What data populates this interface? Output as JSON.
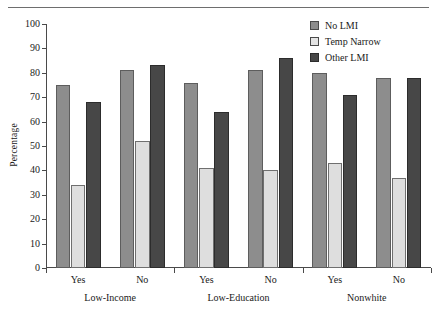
{
  "chart_data": {
    "type": "bar",
    "title": "",
    "xlabel": "",
    "ylabel": "Percentage",
    "ylim": [
      0,
      100
    ],
    "yticks": [
      0,
      10,
      20,
      30,
      40,
      50,
      60,
      70,
      80,
      90,
      100
    ],
    "grid": false,
    "legend_position": "top-right",
    "groups": [
      {
        "name": "Low-Income",
        "categories": [
          "Yes",
          "No"
        ]
      },
      {
        "name": "Low-Education",
        "categories": [
          "Yes",
          "No"
        ]
      },
      {
        "name": "Nonwhite",
        "categories": [
          "Yes",
          "No"
        ]
      }
    ],
    "categories": [
      "Low-Income Yes",
      "Low-Income No",
      "Low-Education Yes",
      "Low-Education No",
      "Nonwhite Yes",
      "Nonwhite No"
    ],
    "series": [
      {
        "name": "No LMI",
        "color": "#8d8d8d",
        "values": [
          75,
          81,
          76,
          81,
          80,
          78
        ]
      },
      {
        "name": "Temp Narrow",
        "color": "#dedede",
        "values": [
          34,
          52,
          41,
          40,
          43,
          37
        ]
      },
      {
        "name": "Other LMI",
        "color": "#474747",
        "values": [
          68,
          83,
          64,
          86,
          71,
          78
        ]
      }
    ]
  },
  "legend": {
    "items": [
      {
        "label": "No LMI"
      },
      {
        "label": "Temp Narrow"
      },
      {
        "label": "Other LMI"
      }
    ]
  },
  "axes": {
    "y_label": "Percentage"
  }
}
